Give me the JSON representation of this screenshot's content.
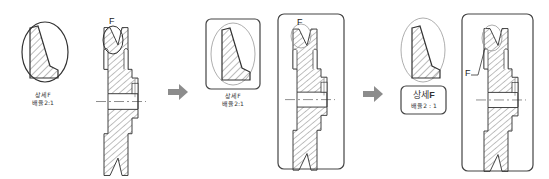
{
  "figure": {
    "steps": [
      {
        "index": 1,
        "detail_marker": "F",
        "detail_label": "상세F",
        "scale_label": "배율2:1"
      },
      {
        "index": 2,
        "detail_marker": "F",
        "detail_label": "상세F",
        "scale_label": "배율2:1"
      },
      {
        "index": 3,
        "detail_marker": "F",
        "detail_label": "상세",
        "detail_letter": "F",
        "scale_label": "배율2 : 1"
      }
    ],
    "arrows": [
      "arrow-right-icon",
      "arrow-right-icon"
    ],
    "colors": {
      "line": "#333333",
      "hatch": "#555555",
      "arrow": "#8c8c8c",
      "frame": "#444444"
    }
  }
}
